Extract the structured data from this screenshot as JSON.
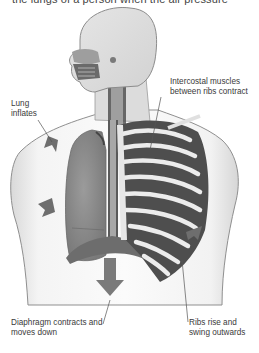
{
  "diagram": {
    "top_caption": "the lungs of a person when the air pressure",
    "labels": {
      "lung": "Lung inflates",
      "intercostal": "Intercostal muscles between ribs contract",
      "diaphragm": "Diaphragm contracts and moves down",
      "ribs": "Ribs rise and swing outwards"
    },
    "arrows": [
      {
        "name": "lung-upper-arrow",
        "direction": "outward-left"
      },
      {
        "name": "lung-side-arrow",
        "direction": "outward-left"
      },
      {
        "name": "diaphragm-arrow",
        "direction": "down"
      },
      {
        "name": "ribs-arrow",
        "direction": "outward-right"
      }
    ],
    "colors": {
      "arrow": "#6e6e6e",
      "lung": "#8a8a8a",
      "skin_outline": "#9a9a9a",
      "rib": "#e8e8e8",
      "label_text": "#3a3a3a",
      "leader_line": "#555555"
    }
  }
}
